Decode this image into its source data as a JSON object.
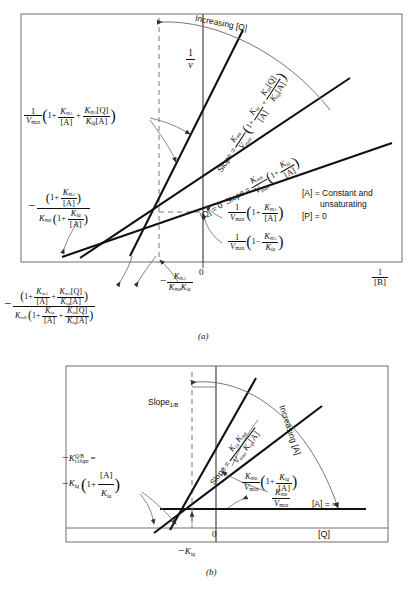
{
  "figure": {
    "panel_a_tag": "(a)",
    "panel_b_tag": "(b)"
  },
  "panel_a": {
    "y_axis_label": "1/v",
    "x_axis_label": "1/[B]",
    "origin_label": "0",
    "increasing_label": "Increasing [Q]",
    "conditions": {
      "line1": "[A] = Constant and",
      "line2": "unsaturating",
      "line3": "[P] = 0"
    },
    "intercept_upper": "1/Vmax (1 + KmA/[A] + KmA[Q]/(Kiq[A]))",
    "intercept_q0": "1/Vmax (1 + KmA/[A])",
    "intercept_common": "1/Vmax (1 - KmA/Kia)",
    "x_intercept_q0": "-(1 + KmA/[A]) / (KmB (1 + Kia/[A]))",
    "x_intercept_upper": "-(1 + KmA/[A] + KmA[Q]/(Kiq[A])) / (KmB (1 + Kia/[A] + Kia[Q]/(Kiq[A])))",
    "x_crossover": "-KmA/(KmB Kia)",
    "slope_upper": "Slope = KmB/Vmax (1 + Kia/[A] + Kia[Q]/(Kiq[A]))",
    "slope_q0_prefix": "[Q] = 0",
    "slope_q0": "Slope = KmB/Vmax (1 + Kia/[A])"
  },
  "panel_b": {
    "y_axis_label": "Slope1/B",
    "x_axis_label": "[Q]",
    "origin_label": "0",
    "increasing_label": "Increasing [A]",
    "slope_label": "Slope = Kia KmB / (Vmax Kiq [A])",
    "y_intercept_label": "KmB/Vmax (1 + Kiq/[A])",
    "asymptote_intercept": "KmB/Vmax",
    "asymptote_label": "[A] = ∞",
    "x_intercept_label": "-Ki,slope^(Q/B) = -Kiq (1 + [A]/Kia)",
    "x_intercept_tick": "-Kiq"
  }
}
